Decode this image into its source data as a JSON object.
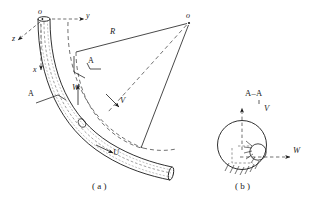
{
  "figure": {
    "title_visible": false,
    "panels": [
      {
        "id": "a",
        "caption": "（a）",
        "caption_plain": "( a )"
      },
      {
        "id": "b",
        "caption": "（b）",
        "caption_plain": "( b )"
      }
    ]
  },
  "panel_a": {
    "origin_label": "o",
    "center_label": "o",
    "axes": [
      {
        "name": "y-axis",
        "label": "y",
        "direction": "right"
      },
      {
        "name": "x-axis",
        "label": "x",
        "direction": "down"
      },
      {
        "name": "z-axis",
        "label": "z",
        "direction": "lower-left"
      }
    ],
    "radius_label": "R",
    "section_marks": [
      {
        "name": "section-a-upper",
        "label": "A"
      },
      {
        "name": "section-a-lower",
        "label": "A"
      }
    ],
    "vectors": [
      {
        "name": "w-vector",
        "label": "W"
      },
      {
        "name": "v-vector",
        "label": "V"
      },
      {
        "name": "u-vector",
        "label": "U"
      }
    ]
  },
  "panel_b": {
    "section_title": "A–A",
    "vectors": [
      {
        "name": "v-vector",
        "label": "V",
        "direction": "up"
      },
      {
        "name": "w-vector",
        "label": "W",
        "direction": "right"
      }
    ]
  },
  "colors": {
    "line": "#1a1a1a",
    "dashed": "#333333",
    "background": "#ffffff",
    "text": "#1a1a1a"
  }
}
